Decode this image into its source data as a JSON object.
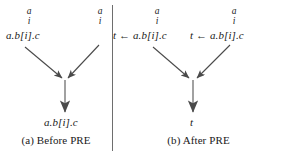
{
  "figure": {
    "panels": [
      {
        "id": "a",
        "caption": "(a) Before PRE",
        "nodes": [
          {
            "name": "left-predecessor",
            "marker_top": "a",
            "marker_bottom": "i",
            "label": "a.b[i].c"
          },
          {
            "name": "right-predecessor",
            "marker_top": "a",
            "marker_bottom": "i",
            "label": ""
          },
          {
            "name": "merge-successor",
            "label": "a.b[i].c"
          }
        ],
        "edges": [
          {
            "from": "left-predecessor",
            "to": "merge-point"
          },
          {
            "from": "right-predecessor",
            "to": "merge-point"
          },
          {
            "from": "merge-point",
            "to": "merge-successor"
          }
        ]
      },
      {
        "id": "b",
        "caption": "(b) After PRE",
        "nodes": [
          {
            "name": "left-predecessor",
            "marker_top": "a",
            "marker_bottom": "i",
            "label": "t ← a.b[i].c"
          },
          {
            "name": "right-predecessor",
            "marker_top": "a",
            "marker_bottom": "i",
            "label": "t ← a.b[i].c"
          },
          {
            "name": "merge-successor",
            "label": "t"
          }
        ],
        "edges": [
          {
            "from": "left-predecessor",
            "to": "merge-point"
          },
          {
            "from": "right-predecessor",
            "to": "merge-point"
          },
          {
            "from": "merge-point",
            "to": "merge-successor"
          }
        ]
      }
    ],
    "colors": {
      "ink": "#1a1a1a",
      "rule": "#6e6e6e",
      "arrow": "#4a4a4a"
    }
  }
}
